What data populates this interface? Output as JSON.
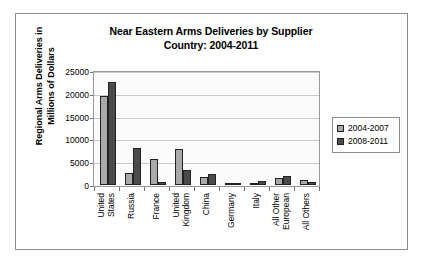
{
  "chart_data": {
    "type": "bar",
    "title": "Near Eastern Arms Deliveries by Supplier Country: 2004-2011",
    "title_lines": [
      "Near Eastern Arms Deliveries by Supplier",
      "Country: 2004-2011"
    ],
    "xlabel": "",
    "ylabel": "Regional Arms Deliveries in Millions of Dollars",
    "ylabel_lines": [
      "Regional Arms Deliveries in",
      "Millions of Dollars"
    ],
    "ylim": [
      0,
      25000
    ],
    "ytick_values": [
      0,
      5000,
      10000,
      15000,
      20000,
      25000
    ],
    "ytick_labels": [
      "0",
      "5000",
      "10000",
      "15000",
      "20000",
      "25000"
    ],
    "grid": true,
    "legend_position": "right",
    "categories": [
      "United States",
      "Russia",
      "France",
      "United Kingdom",
      "China",
      "Germany",
      "Italy",
      "All Other European",
      "All Others"
    ],
    "category_lines": [
      [
        "United",
        "States"
      ],
      [
        "Russia"
      ],
      [
        "France"
      ],
      [
        "United",
        "Kingdom"
      ],
      [
        "China"
      ],
      [
        "Germany"
      ],
      [
        "Italy"
      ],
      [
        "All Other",
        "European"
      ],
      [
        "All Others"
      ]
    ],
    "series": [
      {
        "name": "2004-2007",
        "color": "#a9a9a9",
        "values": [
          19500,
          2700,
          5700,
          8000,
          1700,
          400,
          300,
          1600,
          1200
        ]
      },
      {
        "name": "2008-2011",
        "color": "#4b4b4b",
        "values": [
          22500,
          8200,
          700,
          3300,
          2400,
          500,
          900,
          1900,
          600
        ]
      }
    ]
  }
}
